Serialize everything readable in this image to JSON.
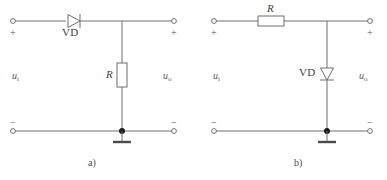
{
  "figure": {
    "background_color": "#ffffff",
    "wire_color": "#6e6e6e",
    "node_color": "#1d1d1d"
  },
  "circuits": [
    {
      "id": "a",
      "caption": "a)",
      "series_component": {
        "type": "diode",
        "label": "VD",
        "orientation": "horizontal-right",
        "position": "series-top-branch"
      },
      "shunt_component": {
        "type": "resistor",
        "label": "R",
        "orientation": "vertical",
        "position": "shunt-middle-branch"
      },
      "input_port": {
        "signal_label": "u",
        "signal_subscript": "i",
        "top_polarity": "+",
        "bottom_polarity": "−"
      },
      "output_port": {
        "signal_label": "u",
        "signal_subscript": "o",
        "top_polarity": "+",
        "bottom_polarity": "−"
      },
      "ground": {
        "symbol": "earth-bar",
        "present": true
      }
    },
    {
      "id": "b",
      "caption": "b)",
      "series_component": {
        "type": "resistor",
        "label": "R",
        "orientation": "horizontal",
        "position": "series-top-branch"
      },
      "shunt_component": {
        "type": "diode",
        "label": "VD",
        "orientation": "vertical-down",
        "position": "shunt-middle-branch"
      },
      "input_port": {
        "signal_label": "u",
        "signal_subscript": "i",
        "top_polarity": "+",
        "bottom_polarity": "−"
      },
      "output_port": {
        "signal_label": "u",
        "signal_subscript": "o",
        "top_polarity": "+",
        "bottom_polarity": "−"
      },
      "ground": {
        "symbol": "earth-bar",
        "present": true
      }
    }
  ]
}
